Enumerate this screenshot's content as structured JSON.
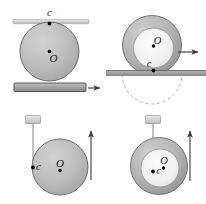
{
  "figure": {
    "width": 206,
    "height": 204,
    "background": "#ffffff",
    "colors": {
      "disk_fill": "#b8b8b8",
      "disk_edge": "#5a5a5a",
      "ring_fill": "#a8a8a8",
      "inner_fill": "#f0f0f0",
      "plate_fill": "#a0a0a0",
      "plate_edge": "#4a4a4a",
      "ground_fill": "#9a9a9a",
      "bar_fill": "#cccccc",
      "arrow": "#3a3a3a",
      "dot": "#000000",
      "label": "#1a1a1a",
      "cord": "#8a8a8a",
      "dashed": "#9a9a9a"
    }
  },
  "panels": [
    {
      "id": "panel-top-left",
      "shape": "solid-disk",
      "labels": {
        "contact": "c",
        "center": "O"
      },
      "surfaces": [
        "top-bar",
        "bottom-plate"
      ],
      "arrows": [
        {
          "name": "plate-motion-arrow",
          "direction": "right"
        }
      ]
    },
    {
      "id": "panel-top-right",
      "shape": "ring-annulus",
      "labels": {
        "center": "O",
        "contact": "c"
      },
      "surfaces": [
        "ground"
      ],
      "arrows": [
        {
          "name": "ring-motion-arrow",
          "direction": "right"
        }
      ],
      "guides": [
        "dashed-rolling-arc"
      ]
    },
    {
      "id": "panel-bottom-left",
      "shape": "solid-disk",
      "labels": {
        "contact": "c",
        "center": "O"
      },
      "surfaces": [
        "hanging-block",
        "cord"
      ],
      "arrows": [
        {
          "name": "disk-motion-arrow",
          "direction": "up"
        }
      ]
    },
    {
      "id": "panel-bottom-right",
      "shape": "ring-annulus",
      "labels": {
        "contact": "c",
        "center": "O"
      },
      "surfaces": [
        "hanging-block",
        "cord"
      ],
      "arrows": [
        {
          "name": "ring-motion-arrow",
          "direction": "up"
        }
      ]
    }
  ]
}
